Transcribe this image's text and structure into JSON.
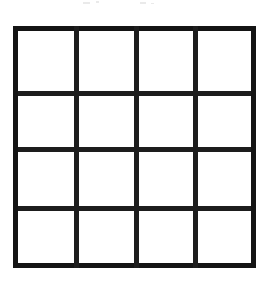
{
  "figure": {
    "title": "",
    "type": "grid",
    "rows": 4,
    "columns": 4,
    "cell_count": 16,
    "background_color": "#ffffff",
    "line_color": "#141414",
    "line_thickness_px": 5,
    "bounds": {
      "left": 13,
      "top": 26,
      "width": 243,
      "height": 242
    },
    "vertical_line_positions": [
      0,
      61,
      121,
      180,
      238
    ],
    "horizontal_line_positions": [
      0,
      65,
      121,
      180,
      237
    ],
    "cells": [
      {
        "row": 1,
        "column": 1,
        "content": ""
      },
      {
        "row": 1,
        "column": 2,
        "content": ""
      },
      {
        "row": 1,
        "column": 3,
        "content": ""
      },
      {
        "row": 1,
        "column": 4,
        "content": ""
      },
      {
        "row": 2,
        "column": 1,
        "content": ""
      },
      {
        "row": 2,
        "column": 2,
        "content": ""
      },
      {
        "row": 2,
        "column": 3,
        "content": ""
      },
      {
        "row": 2,
        "column": 4,
        "content": ""
      },
      {
        "row": 3,
        "column": 1,
        "content": ""
      },
      {
        "row": 3,
        "column": 2,
        "content": ""
      },
      {
        "row": 3,
        "column": 3,
        "content": ""
      },
      {
        "row": 3,
        "column": 4,
        "content": ""
      },
      {
        "row": 4,
        "column": 1,
        "content": ""
      },
      {
        "row": 4,
        "column": 2,
        "content": ""
      },
      {
        "row": 4,
        "column": 3,
        "content": ""
      },
      {
        "row": 4,
        "column": 4,
        "content": ""
      }
    ]
  },
  "artifacts": {
    "label": "scan-speckle",
    "color": "#d9d9d9",
    "count": 4
  }
}
